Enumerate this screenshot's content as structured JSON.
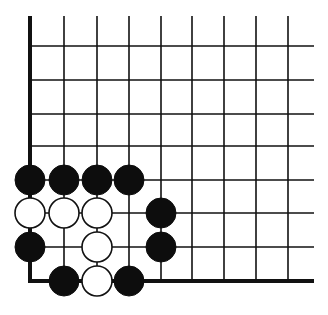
{
  "diagram": {
    "type": "go-board-corner",
    "colors": {
      "background": "#ffffff",
      "line": "#111111",
      "black_stone": "#0d0d0d",
      "white_stone": "#ffffff"
    },
    "grid": {
      "columns_x": [
        30,
        64,
        97,
        129,
        161,
        192,
        224,
        256,
        288
      ],
      "rows_y": [
        46,
        80,
        114,
        146,
        180,
        213,
        247,
        281
      ],
      "top_y": 16,
      "right_x": 314,
      "left_edge_thick": true,
      "bottom_edge_thick": true
    },
    "stones": [
      {
        "color": "black",
        "col": 0,
        "row": 4
      },
      {
        "color": "black",
        "col": 1,
        "row": 4
      },
      {
        "color": "black",
        "col": 2,
        "row": 4
      },
      {
        "color": "black",
        "col": 3,
        "row": 4
      },
      {
        "color": "white",
        "col": 0,
        "row": 5
      },
      {
        "color": "white",
        "col": 1,
        "row": 5
      },
      {
        "color": "white",
        "col": 2,
        "row": 5
      },
      {
        "color": "black",
        "col": 4,
        "row": 5
      },
      {
        "color": "black",
        "col": 0,
        "row": 6
      },
      {
        "color": "white",
        "col": 2,
        "row": 6
      },
      {
        "color": "black",
        "col": 4,
        "row": 6
      },
      {
        "color": "black",
        "col": 1,
        "row": 7
      },
      {
        "color": "white",
        "col": 2,
        "row": 7
      },
      {
        "color": "black",
        "col": 3,
        "row": 7
      }
    ],
    "stone_radius": 15
  }
}
